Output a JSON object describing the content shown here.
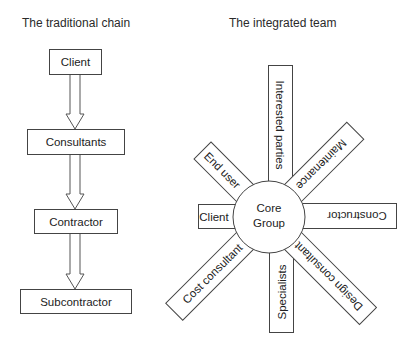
{
  "left": {
    "title": "The traditional chain",
    "chain": [
      {
        "label": "Client"
      },
      {
        "label": "Consultants"
      },
      {
        "label": "Contractor"
      },
      {
        "label": "Subcontractor"
      }
    ]
  },
  "right": {
    "title": "The integrated team",
    "core": {
      "line1": "Core",
      "line2": "Group"
    },
    "spokes": [
      {
        "label": "Interested parties",
        "position": "top"
      },
      {
        "label": "Maintenance",
        "position": "top-right"
      },
      {
        "label": "Constructor",
        "position": "right"
      },
      {
        "label": "Design consultant",
        "position": "bottom-right"
      },
      {
        "label": "Specialists",
        "position": "bottom"
      },
      {
        "label": "Cost consultant",
        "position": "bottom-left"
      },
      {
        "label": "Client",
        "position": "left"
      },
      {
        "label": "End user",
        "position": "top-left"
      }
    ]
  }
}
